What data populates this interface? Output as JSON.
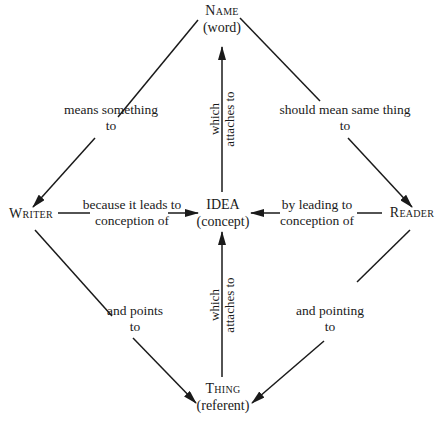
{
  "diagram": {
    "type": "semantic-diagram",
    "nodes": {
      "name": {
        "title": "Name",
        "subtitle": "(word)"
      },
      "idea": {
        "title": "IDEA",
        "subtitle": "(concept)"
      },
      "thing": {
        "title": "Thing",
        "subtitle": "(referent)"
      },
      "writer": {
        "title": "Writer"
      },
      "reader": {
        "title": "Reader"
      }
    },
    "edges": {
      "name_to_writer": {
        "line1": "means something",
        "line2": "to"
      },
      "name_to_reader": {
        "line1": "should mean same thing",
        "line2": "to"
      },
      "idea_to_name": {
        "line1": "which",
        "line2": "attaches to"
      },
      "thing_to_idea": {
        "line1": "which",
        "line2": "attaches to"
      },
      "writer_to_idea": {
        "line1": "because it leads to",
        "line2": "conception of"
      },
      "reader_to_idea": {
        "line1": "by leading to",
        "line2": "conception of"
      },
      "writer_to_thing": {
        "line1": "and points",
        "line2": "to"
      },
      "reader_to_thing": {
        "line1": "and pointing",
        "line2": "to"
      }
    },
    "colors": {
      "ink": "#1a1a1a",
      "background": "#ffffff"
    }
  }
}
